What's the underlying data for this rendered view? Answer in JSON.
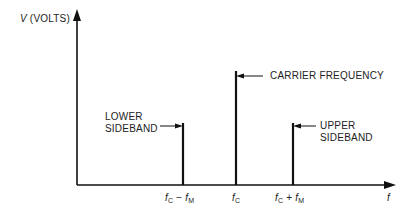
{
  "diagram": {
    "y_axis": {
      "label_var": "V",
      "label_unit": "(VOLTS)"
    },
    "x_axis": {
      "label": "f"
    },
    "components": [
      {
        "name": "lower_sideband",
        "label_line1": "LOWER",
        "label_line2": "SIDEBAND",
        "tick": {
          "main": "f",
          "sub1": "C",
          "op": "−",
          "main2": "f",
          "sub2": "M"
        },
        "relative_amplitude": 0.5
      },
      {
        "name": "carrier",
        "label_line1": "CARRIER FREQUENCY",
        "tick": {
          "main": "f",
          "sub1": "C"
        },
        "relative_amplitude": 1.0
      },
      {
        "name": "upper_sideband",
        "label_line1": "UPPER",
        "label_line2": "SIDEBAND",
        "tick": {
          "main": "f",
          "sub1": "C",
          "op": "+",
          "main2": "f",
          "sub2": "M"
        },
        "relative_amplitude": 0.5
      }
    ],
    "colors": {
      "line": "#111111",
      "background": "#ffffff"
    }
  }
}
